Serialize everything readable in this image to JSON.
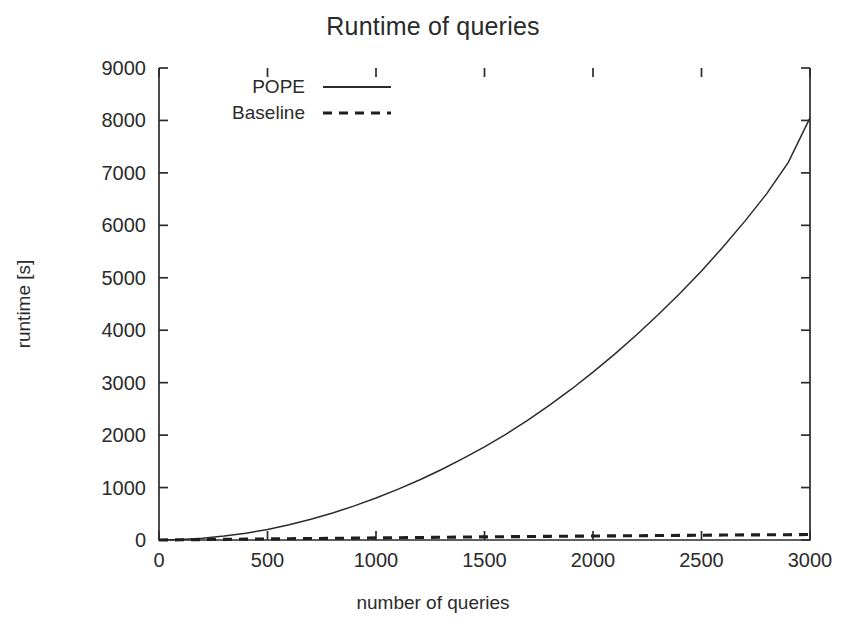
{
  "chart_data": {
    "type": "line",
    "title": "Runtime of queries",
    "xlabel": "number of queries",
    "ylabel": "runtime [s]",
    "xlim": [
      0,
      3000
    ],
    "ylim": [
      0,
      9000
    ],
    "xticks": [
      0,
      500,
      1000,
      1500,
      2000,
      2500,
      3000
    ],
    "yticks": [
      0,
      1000,
      2000,
      3000,
      4000,
      5000,
      6000,
      7000,
      8000,
      9000
    ],
    "grid": false,
    "legend_position": "top-left inside",
    "x": [
      0,
      100,
      200,
      300,
      400,
      500,
      600,
      700,
      800,
      900,
      1000,
      1100,
      1200,
      1300,
      1400,
      1500,
      1600,
      1700,
      1800,
      1900,
      2000,
      2100,
      2200,
      2300,
      2400,
      2500,
      2600,
      2700,
      2800,
      2900,
      3000
    ],
    "series": [
      {
        "name": "POPE",
        "style": "solid",
        "color": "#2b2b2b",
        "values": [
          0,
          10,
          35,
          75,
          130,
          200,
          290,
          395,
          515,
          650,
          800,
          965,
          1145,
          1340,
          1550,
          1775,
          2020,
          2285,
          2570,
          2875,
          3200,
          3545,
          3910,
          4295,
          4700,
          5130,
          5590,
          6080,
          6600,
          7200,
          8050
        ]
      },
      {
        "name": "Baseline",
        "style": "dashed",
        "color": "#1e1e1e",
        "values": [
          0,
          4,
          8,
          12,
          16,
          20,
          24,
          28,
          32,
          36,
          40,
          44,
          48,
          52,
          56,
          60,
          63,
          66,
          70,
          73,
          76,
          79,
          82,
          85,
          88,
          91,
          94,
          97,
          99,
          101,
          104
        ]
      }
    ]
  },
  "legend": {
    "entries": [
      {
        "label": "POPE",
        "style": "solid"
      },
      {
        "label": "Baseline",
        "style": "dashed"
      }
    ]
  }
}
